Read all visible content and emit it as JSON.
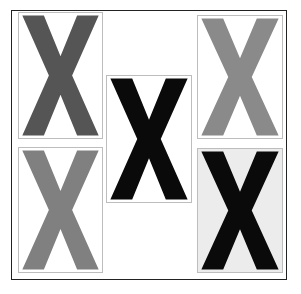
{
  "figure": {
    "type": "simultaneous-contrast illusion",
    "glyph": "X",
    "frame_color": "#222222",
    "panels": [
      {
        "id": "top-left",
        "letter": "X",
        "letter_color": "#555555",
        "background": "#ffffff",
        "x": 18,
        "y": 12,
        "w": 85,
        "h": 127
      },
      {
        "id": "bottom-left",
        "letter": "X",
        "letter_color": "#808080",
        "background": "#ffffff",
        "x": 18,
        "y": 147,
        "w": 85,
        "h": 126
      },
      {
        "id": "center",
        "letter": "X",
        "letter_color": "#0a0a0a",
        "background": "#ffffff",
        "x": 106,
        "y": 75,
        "w": 86,
        "h": 128
      },
      {
        "id": "top-right",
        "letter": "X",
        "letter_color": "#8a8a8a",
        "background": "#ffffff",
        "x": 197,
        "y": 15,
        "w": 86,
        "h": 124
      },
      {
        "id": "bottom-right",
        "letter": "X",
        "letter_color": "#0a0a0a",
        "background": "#ececec",
        "x": 197,
        "y": 148,
        "w": 86,
        "h": 125
      }
    ]
  }
}
